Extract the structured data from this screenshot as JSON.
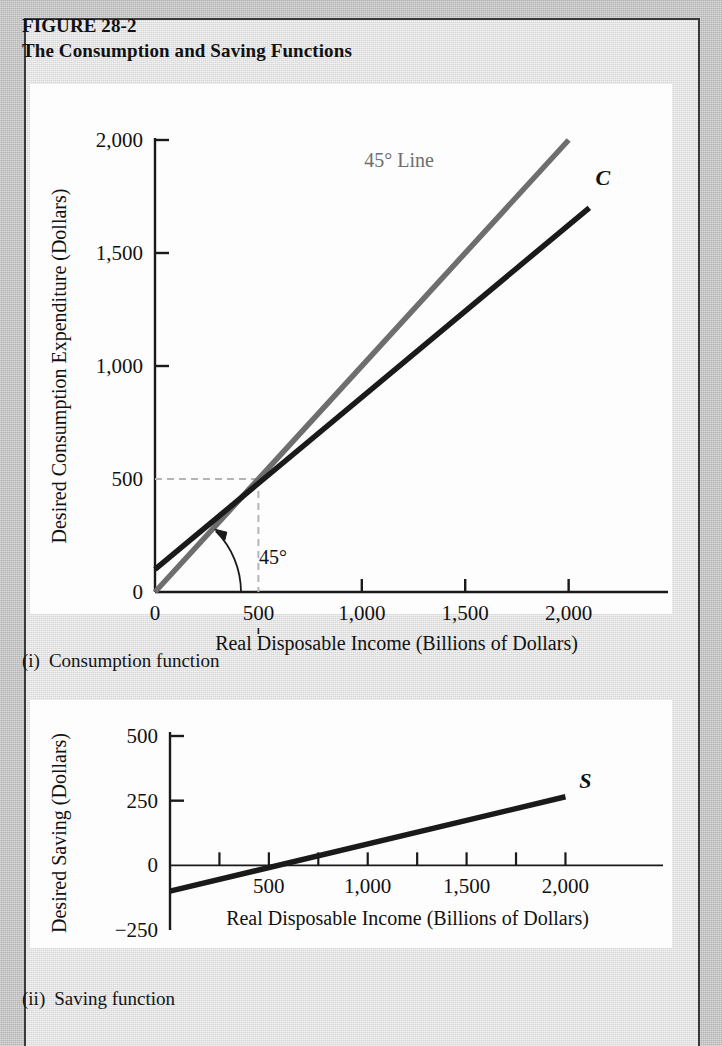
{
  "figure": {
    "number": "FIGURE 28-2",
    "title": "The Consumption and Saving Functions"
  },
  "captions": {
    "panel1_num": "(i)",
    "panel1_text": "Consumption function",
    "panel2_num": "(ii)",
    "panel2_text": "Saving function"
  },
  "colors": {
    "page_background": "#b9b9b9",
    "panel_background": "#dcdcdc",
    "plot_background": "#fdfdfd",
    "frame_border": "#3a3a3a",
    "curve_black": "#1a1a1a",
    "line_gray": "#6e6e6e",
    "guide_dashed": "#b5b5b5"
  },
  "chart_data": [
    {
      "type": "line",
      "panel": "(i) Consumption function",
      "title": "The Consumption and Saving Functions",
      "xlabel": "Real Disposable Income (Billions of Dollars)",
      "ylabel": "Desired Consumption Expenditure (Dollars)",
      "xlim": [
        0,
        2200
      ],
      "ylim": [
        0,
        2000
      ],
      "xticks": [
        0,
        500,
        1000,
        1500,
        2000
      ],
      "xticklabels": [
        "0",
        "500",
        "1,000",
        "1,500",
        "2,000"
      ],
      "yticks": [
        0,
        500,
        1000,
        1500,
        2000
      ],
      "yticklabels": [
        "0",
        "500",
        "1,000",
        "1,500",
        "2,000"
      ],
      "grid": false,
      "legend": "inline-labels",
      "series": [
        {
          "name": "45° Line",
          "label": "45° Line",
          "color": "#6e6e6e",
          "x": [
            0,
            2000
          ],
          "y": [
            0,
            2000
          ]
        },
        {
          "name": "C",
          "label": "C",
          "color": "#1a1a1a",
          "x": [
            0,
            2100
          ],
          "y": [
            100,
            1700
          ]
        }
      ],
      "annotations": [
        {
          "name": "angle-label",
          "text": "45°",
          "x": 330,
          "y": 180
        },
        {
          "name": "break-even-guide-x",
          "text": "500",
          "value": 500
        },
        {
          "name": "break-even-guide-y",
          "text": "500",
          "value": 500
        }
      ]
    },
    {
      "type": "line",
      "panel": "(ii) Saving function",
      "xlabel": "Real Disposable Income (Billions of Dollars)",
      "ylabel": "Desired Saving (Dollars)",
      "xlim": [
        0,
        2200
      ],
      "ylim": [
        -250,
        500
      ],
      "xticks": [
        250,
        500,
        750,
        1000,
        1250,
        1500,
        1750,
        2000
      ],
      "xticklabels": [
        "",
        "500",
        "",
        "1,000",
        "",
        "1,500",
        "",
        "2,000"
      ],
      "yticks": [
        -250,
        0,
        250,
        500
      ],
      "yticklabels": [
        "−250",
        "0",
        "250",
        "500"
      ],
      "grid": false,
      "series": [
        {
          "name": "S",
          "label": "S",
          "color": "#1a1a1a",
          "x": [
            0,
            2000
          ],
          "y": [
            -100,
            265
          ]
        }
      ]
    }
  ]
}
